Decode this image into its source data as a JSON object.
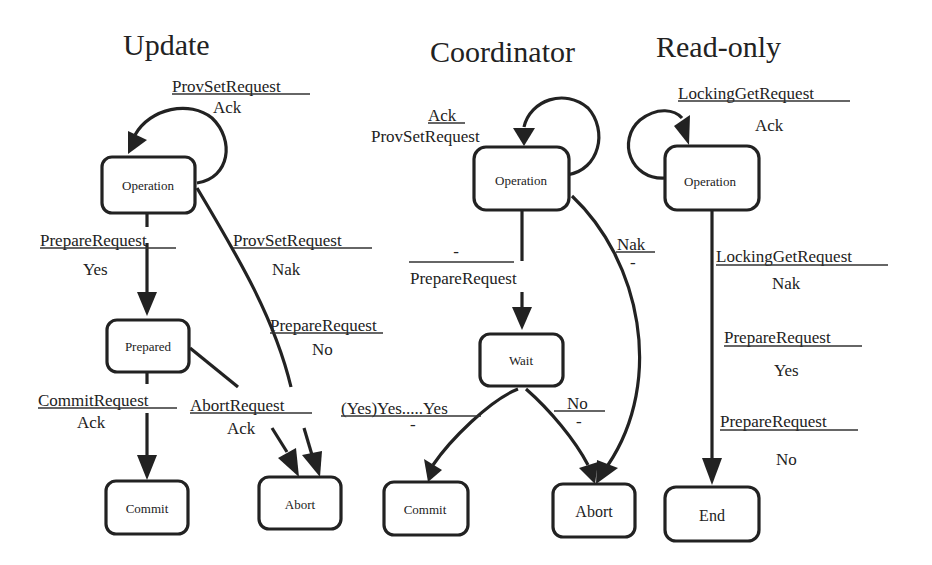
{
  "diagram": {
    "colors": {
      "ink": "#222222",
      "background": "#ffffff"
    },
    "machines": [
      {
        "id": "update",
        "title": "Update",
        "states": [
          {
            "id": "u-operation",
            "label": "Operation"
          },
          {
            "id": "u-prepared",
            "label": "Prepared"
          },
          {
            "id": "u-commit",
            "label": "Commit"
          },
          {
            "id": "u-abort",
            "label": "Abort"
          }
        ],
        "transitions": [
          {
            "from": "u-operation",
            "to": "u-operation",
            "input": "ProvSetRequest",
            "output": "Ack"
          },
          {
            "from": "u-operation",
            "to": "u-prepared",
            "input": "PrepareRequest",
            "output": "Yes"
          },
          {
            "from": "u-operation",
            "to": "u-abort",
            "input": "ProvSetRequest",
            "output": "Nak"
          },
          {
            "from": "u-operation",
            "to": "u-abort",
            "input": "PrepareRequest",
            "output": "No"
          },
          {
            "from": "u-prepared",
            "to": "u-commit",
            "input": "CommitRequest",
            "output": "Ack"
          },
          {
            "from": "u-prepared",
            "to": "u-abort",
            "input": "AbortRequest",
            "output": "Ack"
          }
        ]
      },
      {
        "id": "coordinator",
        "title": "Coordinator",
        "states": [
          {
            "id": "c-operation",
            "label": "Operation"
          },
          {
            "id": "c-wait",
            "label": "Wait"
          },
          {
            "id": "c-commit",
            "label": "Commit"
          },
          {
            "id": "c-abort",
            "label": "Abort"
          }
        ],
        "transitions": [
          {
            "from": "c-operation",
            "to": "c-operation",
            "input": "Ack",
            "output": "ProvSetRequest"
          },
          {
            "from": "c-operation",
            "to": "c-wait",
            "input": "-",
            "output": "PrepareRequest"
          },
          {
            "from": "c-operation",
            "to": "c-abort",
            "input": "Nak",
            "output": "-"
          },
          {
            "from": "c-wait",
            "to": "c-commit",
            "input": "(Yes)Yes.....Yes",
            "output": "-"
          },
          {
            "from": "c-wait",
            "to": "c-abort",
            "input": "No",
            "output": "-"
          }
        ]
      },
      {
        "id": "readonly",
        "title": "Read-only",
        "states": [
          {
            "id": "r-operation",
            "label": "Operation"
          },
          {
            "id": "r-end",
            "label": "End"
          }
        ],
        "transitions": [
          {
            "from": "r-operation",
            "to": "r-operation",
            "input": "LockingGetRequest",
            "output": "Ack"
          },
          {
            "from": "r-operation",
            "to": "r-end",
            "input": "LockingGetRequest",
            "output": "Nak"
          },
          {
            "from": "r-operation",
            "to": "r-end",
            "input": "PrepareRequest",
            "output": "Yes"
          },
          {
            "from": "r-operation",
            "to": "r-end",
            "input": "PrepareRequest",
            "output": "No"
          }
        ]
      }
    ]
  }
}
